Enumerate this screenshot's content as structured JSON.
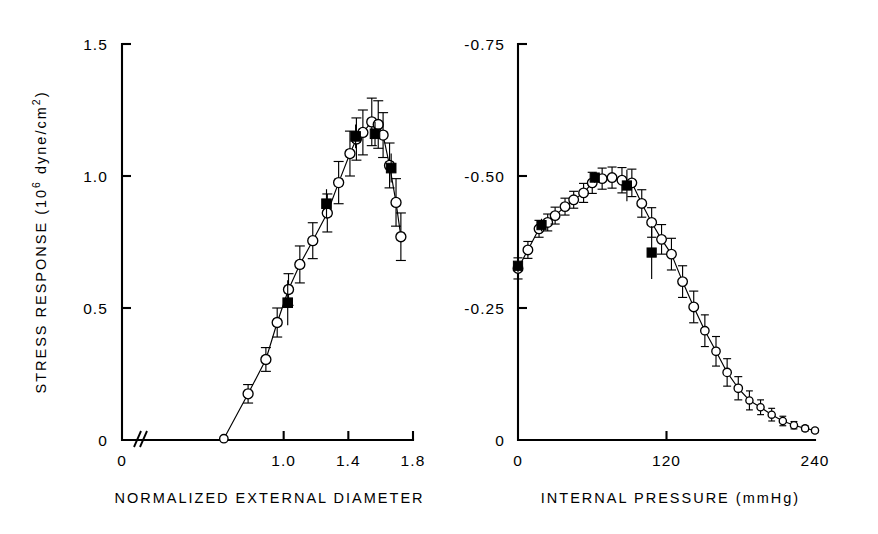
{
  "figure": {
    "background": "#ffffff",
    "ink_color": "#000000",
    "panels": 2
  },
  "chart_data": [
    {
      "id": "stress-response-panel",
      "type": "line",
      "title": "",
      "xlabel": "NORMALIZED EXTERNAL DIAMETER",
      "ylabel": "STRESS RESPONSE  (10⁶ dyne/cm²)",
      "ylabel_parts": {
        "main": "STRESS  RESPONSE  (10",
        "exp": "6",
        "tail": " dyne/cm",
        "exp2": "2",
        "close": ")"
      },
      "xlim": [
        0.0,
        1.8
      ],
      "ylim": [
        0.0,
        1.5
      ],
      "xticks": [
        0,
        1.0,
        1.4,
        1.8
      ],
      "xticklabels": [
        "0",
        "1.0",
        "1.4",
        "1.8"
      ],
      "yticks": [
        0,
        0.5,
        1.0,
        1.5
      ],
      "yticklabels": [
        "0",
        "0.5",
        "1.0",
        "1.5"
      ],
      "grid": false,
      "legend": "none",
      "axis_break": {
        "axis": "x",
        "symbol": "//",
        "between": [
          0.0,
          0.6
        ]
      },
      "series": [
        {
          "name": "open-circles",
          "marker": "open-circle",
          "connected": true,
          "points": [
            {
              "x": 0.63,
              "y": 0.005,
              "yerr": 0.0,
              "xerr": 0.0
            },
            {
              "x": 0.78,
              "y": 0.175,
              "yerr": 0.035,
              "xerr": 0.02
            },
            {
              "x": 0.89,
              "y": 0.305,
              "yerr": 0.045,
              "xerr": 0.022
            },
            {
              "x": 0.96,
              "y": 0.445,
              "yerr": 0.055,
              "xerr": 0.022
            },
            {
              "x": 1.03,
              "y": 0.57,
              "yerr": 0.06,
              "xerr": 0.022
            },
            {
              "x": 1.1,
              "y": 0.665,
              "yerr": 0.07,
              "xerr": 0.022
            },
            {
              "x": 1.18,
              "y": 0.755,
              "yerr": 0.068,
              "xerr": 0.022
            },
            {
              "x": 1.27,
              "y": 0.86,
              "yerr": 0.072,
              "xerr": 0.022
            },
            {
              "x": 1.34,
              "y": 0.975,
              "yerr": 0.08,
              "xerr": 0.022
            },
            {
              "x": 1.41,
              "y": 1.085,
              "yerr": 0.085,
              "xerr": 0.022
            },
            {
              "x": 1.45,
              "y": 1.14,
              "yerr": 0.08,
              "xerr": 0.022
            },
            {
              "x": 1.49,
              "y": 1.165,
              "yerr": 0.085,
              "xerr": 0.022
            },
            {
              "x": 1.545,
              "y": 1.205,
              "yerr": 0.09,
              "xerr": 0.022
            },
            {
              "x": 1.585,
              "y": 1.195,
              "yerr": 0.09,
              "xerr": 0.022
            },
            {
              "x": 1.615,
              "y": 1.155,
              "yerr": 0.085,
              "xerr": 0.022
            },
            {
              "x": 1.655,
              "y": 1.04,
              "yerr": 0.085,
              "xerr": 0.022
            },
            {
              "x": 1.695,
              "y": 0.9,
              "yerr": 0.09,
              "xerr": 0.022
            },
            {
              "x": 1.725,
              "y": 0.77,
              "yerr": 0.09,
              "xerr": 0.022
            }
          ]
        },
        {
          "name": "filled-squares",
          "marker": "filled-square",
          "connected": false,
          "points": [
            {
              "x": 1.025,
              "y": 0.52,
              "yerr": 0.085,
              "xerr": 0.0
            },
            {
              "x": 1.265,
              "y": 0.895,
              "yerr": 0.055,
              "xerr": 0.0
            },
            {
              "x": 1.445,
              "y": 1.15,
              "yerr": 0.045,
              "xerr": 0.0
            },
            {
              "x": 1.565,
              "y": 1.16,
              "yerr": 0.045,
              "xerr": 0.0
            },
            {
              "x": 1.665,
              "y": 1.03,
              "yerr": 0.055,
              "xerr": 0.0
            }
          ]
        }
      ]
    },
    {
      "id": "diameter-response-panel",
      "type": "line",
      "title": "",
      "xlabel": "INTERNAL  PRESSURE  (mmHg)",
      "ylabel": "NORMALIZED  DIAMETER  RESPONSE",
      "xlim": [
        0,
        240
      ],
      "ylim": [
        0,
        0.75
      ],
      "xticks": [
        0,
        120,
        240
      ],
      "xticklabels": [
        "0",
        "120",
        "240"
      ],
      "yticks": [
        0,
        0.25,
        0.5,
        0.75
      ],
      "yticklabels": [
        "0",
        "-0.25",
        "-0.50",
        "-0.75"
      ],
      "grid": false,
      "legend": "none",
      "series": [
        {
          "name": "open-circles",
          "marker": "open-circle",
          "connected": true,
          "points": [
            {
              "x": 0,
              "y": 0.325,
              "yerr": 0.02
            },
            {
              "x": 8,
              "y": 0.36,
              "yerr": 0.016
            },
            {
              "x": 17,
              "y": 0.4,
              "yerr": 0.016
            },
            {
              "x": 24,
              "y": 0.412,
              "yerr": 0.016
            },
            {
              "x": 30,
              "y": 0.425,
              "yerr": 0.016
            },
            {
              "x": 38,
              "y": 0.442,
              "yerr": 0.016
            },
            {
              "x": 45,
              "y": 0.455,
              "yerr": 0.016
            },
            {
              "x": 53,
              "y": 0.468,
              "yerr": 0.018
            },
            {
              "x": 60,
              "y": 0.487,
              "yerr": 0.02
            },
            {
              "x": 68,
              "y": 0.495,
              "yerr": 0.02
            },
            {
              "x": 76,
              "y": 0.497,
              "yerr": 0.02
            },
            {
              "x": 84,
              "y": 0.492,
              "yerr": 0.024
            },
            {
              "x": 92,
              "y": 0.487,
              "yerr": 0.026
            },
            {
              "x": 100,
              "y": 0.448,
              "yerr": 0.026
            },
            {
              "x": 108,
              "y": 0.412,
              "yerr": 0.028
            },
            {
              "x": 116,
              "y": 0.38,
              "yerr": 0.028
            },
            {
              "x": 124,
              "y": 0.352,
              "yerr": 0.03
            },
            {
              "x": 133,
              "y": 0.3,
              "yerr": 0.03
            },
            {
              "x": 142,
              "y": 0.252,
              "yerr": 0.03
            },
            {
              "x": 151,
              "y": 0.207,
              "yerr": 0.03
            },
            {
              "x": 160,
              "y": 0.168,
              "yerr": 0.028
            },
            {
              "x": 169,
              "y": 0.128,
              "yerr": 0.026
            },
            {
              "x": 178,
              "y": 0.098,
              "yerr": 0.022
            },
            {
              "x": 187,
              "y": 0.075,
              "yerr": 0.018
            },
            {
              "x": 196,
              "y": 0.062,
              "yerr": 0.014
            },
            {
              "x": 205,
              "y": 0.048,
              "yerr": 0.012
            },
            {
              "x": 214,
              "y": 0.036,
              "yerr": 0.009
            },
            {
              "x": 223,
              "y": 0.028,
              "yerr": 0.007
            },
            {
              "x": 232,
              "y": 0.022,
              "yerr": 0.005
            },
            {
              "x": 240,
              "y": 0.018,
              "yerr": 0.004
            }
          ]
        },
        {
          "name": "filled-squares",
          "marker": "filled-square",
          "connected": false,
          "points": [
            {
              "x": 0,
              "y": 0.33,
              "yerr": 0.012
            },
            {
              "x": 19,
              "y": 0.407,
              "yerr": 0.012
            },
            {
              "x": 62,
              "y": 0.497,
              "yerr": 0.01
            },
            {
              "x": 88,
              "y": 0.482,
              "yerr": 0.03
            },
            {
              "x": 108,
              "y": 0.355,
              "yerr": 0.05
            }
          ]
        }
      ]
    }
  ]
}
